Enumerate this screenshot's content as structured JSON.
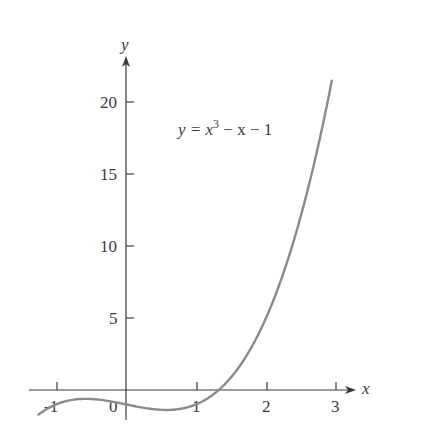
{
  "chart_data": {
    "type": "line",
    "title": "",
    "xlabel": "x",
    "ylabel": "y",
    "xlim": [
      -1.25,
      3.4
    ],
    "ylim": [
      -3,
      23
    ],
    "grid": false,
    "x_ticks": [
      -1,
      0,
      1,
      2,
      3
    ],
    "x_tick_labels": [
      "-1",
      "0",
      "1",
      "2",
      "3"
    ],
    "y_ticks": [
      5,
      10,
      15,
      20
    ],
    "y_tick_labels": [
      "5",
      "10",
      "15",
      "20"
    ],
    "series": [
      {
        "name": "y = x^3 - x - 1",
        "function": "x^3 - x - 1",
        "domain": [
          -1.25,
          2.94
        ],
        "color": "#8a8a8a",
        "x": [
          -1.25,
          -1,
          -0.577,
          0,
          0.577,
          1,
          1.325,
          1.5,
          2,
          2.5,
          2.94
        ],
        "y": [
          -1.7,
          -1,
          -0.615,
          -1,
          -1.385,
          -1,
          0,
          0.875,
          5,
          11.125,
          21.47
        ]
      }
    ],
    "annotations": [
      {
        "text_parts": [
          "y = x",
          "3",
          " − x − 1"
        ],
        "x": 1.1,
        "y": 19.5
      }
    ]
  },
  "labels": {
    "x_axis": "x",
    "y_axis": "y",
    "equation_prefix": "y = x",
    "equation_exponent": "3",
    "equation_suffix": " − x − 1",
    "x_ticks": [
      "-1",
      "0",
      "1",
      "2",
      "3"
    ],
    "y_ticks": [
      "5",
      "10",
      "15",
      "20"
    ]
  },
  "colors": {
    "axis": "#3a3a3a",
    "curve": "#8a8a8a",
    "text": "#3a3a3a"
  }
}
